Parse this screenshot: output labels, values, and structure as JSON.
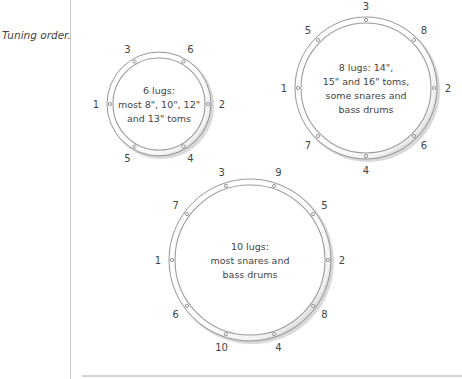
{
  "caption": "Tuning order.",
  "colors": {
    "rim": "#8a8a8a",
    "inner_rim": "#9a9a9a",
    "shadow": "#bdbdbd",
    "text": "#444444"
  },
  "drums": [
    {
      "id": "6-lug",
      "cx": 159,
      "cy": 104,
      "r": 52,
      "label_lines": [
        "6 lugs:",
        "most 8\", 10\", 12\"",
        "and 13\" toms"
      ],
      "lugs": [
        {
          "n": "1",
          "angle": 180
        },
        {
          "n": "2",
          "angle": 0
        },
        {
          "n": "3",
          "angle": 120
        },
        {
          "n": "4",
          "angle": 300
        },
        {
          "n": "5",
          "angle": 240
        },
        {
          "n": "6",
          "angle": 60
        }
      ]
    },
    {
      "id": "8-lug",
      "cx": 366,
      "cy": 88,
      "r": 71,
      "label_lines": [
        "8 lugs: 14\",",
        "15\" and 16\" toms,",
        "some snares and",
        "bass drums"
      ],
      "lugs": [
        {
          "n": "1",
          "angle": 180
        },
        {
          "n": "2",
          "angle": 0
        },
        {
          "n": "3",
          "angle": 90
        },
        {
          "n": "4",
          "angle": 270
        },
        {
          "n": "5",
          "angle": 135
        },
        {
          "n": "6",
          "angle": 315
        },
        {
          "n": "7",
          "angle": 225
        },
        {
          "n": "8",
          "angle": 45
        }
      ]
    },
    {
      "id": "10-lug",
      "cx": 250,
      "cy": 260,
      "r": 81,
      "label_lines": [
        "10 lugs:",
        "most snares and",
        "bass drums"
      ],
      "lugs": [
        {
          "n": "1",
          "angle": 180
        },
        {
          "n": "2",
          "angle": 0
        },
        {
          "n": "3",
          "angle": 108
        },
        {
          "n": "4",
          "angle": 288
        },
        {
          "n": "5",
          "angle": 36
        },
        {
          "n": "6",
          "angle": 216
        },
        {
          "n": "7",
          "angle": 144
        },
        {
          "n": "8",
          "angle": 324
        },
        {
          "n": "9",
          "angle": 72
        },
        {
          "n": "10",
          "angle": 252
        }
      ]
    }
  ]
}
